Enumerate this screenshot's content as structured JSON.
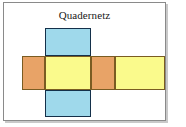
{
  "figure": {
    "title": "Quadernetz",
    "kind": "cuboid-net-diagram",
    "frame": {
      "border_color": "#8a8a8a",
      "shadow_color": "#c9c9c9",
      "background": "#ffffff"
    },
    "palette": {
      "orange_fill": "#e8a367",
      "yellow_fill": "#fafa8c",
      "blue_fill": "#9fd9eb",
      "warm_border": "#7a5c22",
      "cool_border": "#14304a",
      "title_color": "#1a1a1a"
    },
    "faces": [
      {
        "name": "top-flap",
        "label": "",
        "fill": "#9fd9eb",
        "border": "#14304a",
        "x": 45,
        "y": 28,
        "w": 46,
        "h": 28,
        "row": "vertical"
      },
      {
        "name": "left-face",
        "label": "",
        "fill": "#e8a367",
        "border": "#7a5c22",
        "x": 22,
        "y": 56,
        "w": 23,
        "h": 34,
        "row": "horizontal"
      },
      {
        "name": "front-face",
        "label": "",
        "fill": "#fafa8c",
        "border": "#7a5c22",
        "x": 45,
        "y": 56,
        "w": 46,
        "h": 34,
        "row": "horizontal"
      },
      {
        "name": "right-face",
        "label": "",
        "fill": "#e8a367",
        "border": "#7a5c22",
        "x": 91,
        "y": 56,
        "w": 24,
        "h": 34,
        "row": "horizontal"
      },
      {
        "name": "back-face",
        "label": "",
        "fill": "#fafa8c",
        "border": "#7a5c22",
        "x": 115,
        "y": 56,
        "w": 50,
        "h": 34,
        "row": "horizontal"
      },
      {
        "name": "bottom-flap",
        "label": "",
        "fill": "#9fd9eb",
        "border": "#14304a",
        "x": 45,
        "y": 90,
        "w": 46,
        "h": 27,
        "row": "vertical"
      }
    ]
  }
}
